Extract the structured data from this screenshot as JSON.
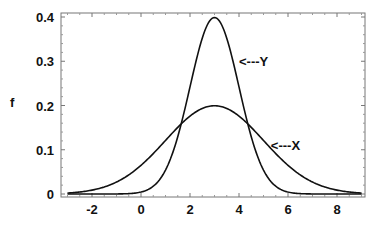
{
  "chart_data": {
    "type": "line",
    "title": "",
    "xlabel": "",
    "ylabel": "f",
    "xlim": [
      -3.3,
      9.1
    ],
    "ylim": [
      -0.008,
      0.41
    ],
    "grid": false,
    "legend": "none (inline annotations)",
    "x_ticks": [
      -2,
      0,
      2,
      4,
      6,
      8
    ],
    "x_tick_labels": [
      "-2",
      "0",
      "2",
      "4",
      "6",
      "8"
    ],
    "y_ticks": [
      0,
      0.1,
      0.2,
      0.3,
      0.4
    ],
    "y_tick_labels": [
      "0",
      "0.1",
      "0.2",
      "0.3",
      "0.4"
    ],
    "series": [
      {
        "name": "X",
        "distribution": "normal",
        "mean": 3,
        "sd": 2,
        "peak": 0.199,
        "x": [
          -3,
          -2,
          -1,
          0,
          1,
          2,
          3,
          4,
          5,
          6,
          7,
          8,
          9
        ],
        "y": [
          0.002,
          0.009,
          0.027,
          0.065,
          0.121,
          0.176,
          0.199,
          0.176,
          0.121,
          0.065,
          0.027,
          0.009,
          0.002
        ]
      },
      {
        "name": "Y",
        "distribution": "normal",
        "mean": 3,
        "sd": 1,
        "peak": 0.399,
        "x": [
          -3,
          -2,
          -1,
          0,
          1,
          2,
          3,
          4,
          5,
          6,
          7,
          8,
          9
        ],
        "y": [
          0.0,
          0.0,
          0.0,
          0.004,
          0.054,
          0.242,
          0.399,
          0.242,
          0.054,
          0.004,
          0.0,
          0.0,
          0.0
        ]
      }
    ],
    "annotations": [
      {
        "text": "<---Y",
        "x": 4.0,
        "y": 0.3
      },
      {
        "text": "<---X",
        "x": 5.3,
        "y": 0.11
      }
    ]
  }
}
